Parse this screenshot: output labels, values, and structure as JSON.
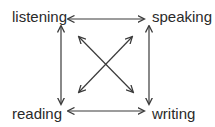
{
  "diagram": {
    "type": "relationship-diagram",
    "nodes": {
      "top_left": "listening",
      "top_right": "speaking",
      "bottom_left": "reading",
      "bottom_right": "writing"
    },
    "edges": [
      {
        "from": "listening",
        "to": "speaking",
        "direction": "bidirectional"
      },
      {
        "from": "reading",
        "to": "writing",
        "direction": "bidirectional"
      },
      {
        "from": "listening",
        "to": "reading",
        "direction": "bidirectional"
      },
      {
        "from": "speaking",
        "to": "writing",
        "direction": "bidirectional"
      },
      {
        "from": "listening",
        "to": "writing",
        "direction": "bidirectional"
      },
      {
        "from": "speaking",
        "to": "reading",
        "direction": "bidirectional"
      }
    ],
    "colors": {
      "line": "#3a3a3a",
      "text": "#2a2a2a",
      "background": "#ffffff"
    }
  }
}
